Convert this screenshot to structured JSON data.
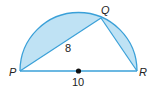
{
  "diagram": {
    "type": "semicircle-inscribed-triangle",
    "points": {
      "P": {
        "label": "P"
      },
      "Q": {
        "label": "Q"
      },
      "R": {
        "label": "R"
      }
    },
    "segment_labels": {
      "PQ": "8",
      "PR": "10"
    },
    "center_marker": "center-point",
    "colors": {
      "fill": "#bfe2f4",
      "stroke": "#3aa0d8",
      "text": "#222222"
    }
  }
}
